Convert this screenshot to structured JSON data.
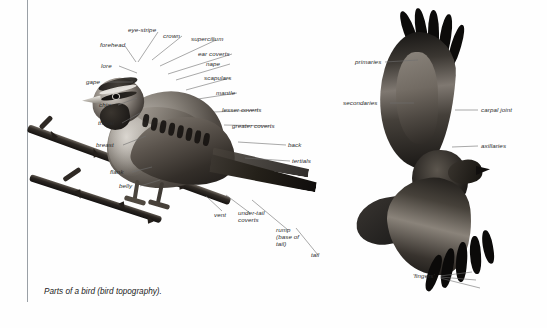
{
  "figure": {
    "caption": "Parts of a bird (bird topography).",
    "background_color": "#ffffff",
    "rule_color": "#9aa0a6",
    "label_color": "#2b2b2b",
    "leader_color": "#6f6f6f"
  },
  "perched_bird": {
    "name": "perched passerine diagram",
    "labels": [
      {
        "id": "eye-stripe",
        "text": "eye-stripe"
      },
      {
        "id": "crown",
        "text": "crown"
      },
      {
        "id": "supercilium",
        "text": "supercilium"
      },
      {
        "id": "forehead",
        "text": "forehead"
      },
      {
        "id": "ear-coverts",
        "text": "ear coverts"
      },
      {
        "id": "nape",
        "text": "nape"
      },
      {
        "id": "scapulars",
        "text": "scapulars"
      },
      {
        "id": "lore",
        "text": "lore"
      },
      {
        "id": "gape",
        "text": "gape"
      },
      {
        "id": "mantle",
        "text": "mantle"
      },
      {
        "id": "chin",
        "text": "chin"
      },
      {
        "id": "lesser-coverts",
        "text": "lesser coverts"
      },
      {
        "id": "throat",
        "text": "throat"
      },
      {
        "id": "greater-coverts",
        "text": "greater coverts"
      },
      {
        "id": "breast",
        "text": "breast"
      },
      {
        "id": "back",
        "text": "back"
      },
      {
        "id": "tertials",
        "text": "tertials"
      },
      {
        "id": "flank",
        "text": "flank"
      },
      {
        "id": "belly",
        "text": "belly"
      },
      {
        "id": "vent",
        "text": "vent"
      },
      {
        "id": "under-tail-coverts",
        "text": "under-tail coverts"
      },
      {
        "id": "rump",
        "text": "rump (base of tail)"
      },
      {
        "id": "tail",
        "text": "tail"
      }
    ]
  },
  "flying_bird": {
    "name": "raptor in flight diagram",
    "labels": [
      {
        "id": "primaries",
        "text": "primaries"
      },
      {
        "id": "secondaries",
        "text": "secondaries"
      },
      {
        "id": "carpal-joint",
        "text": "carpal joint"
      },
      {
        "id": "axillaries",
        "text": "axillaries"
      },
      {
        "id": "fingers",
        "text": "'fingers'"
      }
    ]
  }
}
